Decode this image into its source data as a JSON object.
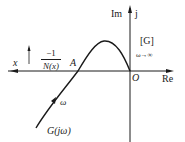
{
  "diagram": {
    "axes": {
      "real_label": "Re",
      "imag_label": "Im",
      "imag_unit": "j",
      "origin_label": "O",
      "x_label": "x"
    },
    "describing_function": {
      "numerator": "−1",
      "denominator": "N(x)"
    },
    "intersection_label": "A",
    "plane_label": "[G]",
    "limit_label": "ω→∞",
    "curve_direction_label": "ω",
    "curve_label": "G(jω)",
    "colors": {
      "line": "#1a1a1a",
      "background": "#ffffff"
    }
  }
}
